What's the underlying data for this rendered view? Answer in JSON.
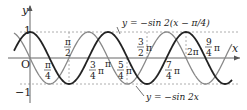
{
  "chart_data": {
    "type": "line",
    "title": "",
    "xlabel": "x",
    "ylabel": "y",
    "origin_label": "O",
    "ylim": [
      -1,
      1
    ],
    "xlim_radians": [
      -0.7,
      5.3
    ],
    "y_ticks": [
      "1",
      "-1"
    ],
    "x_tick_labels": [
      "π/4",
      "π/2",
      "3/4 π",
      "π",
      "5/4 π",
      "3/2 π",
      "7/4 π",
      "2π",
      "9/4 π"
    ],
    "series": [
      {
        "name": "y = -sin 2x",
        "style": "gray thin",
        "formula": "-sin(2x)",
        "x": [
          0,
          0.7854,
          1.5708,
          2.3562,
          3.1416,
          3.927,
          4.7124,
          5.4978,
          6.2832
        ],
        "y": [
          0,
          -1,
          0,
          1,
          0,
          -1,
          0,
          1,
          0
        ]
      },
      {
        "name": "y = -sin 2(x - π/4)",
        "style": "black thick",
        "formula": "-sin(2(x-π/4))",
        "x": [
          0,
          0.7854,
          1.5708,
          2.3562,
          3.1416,
          3.927,
          4.7124,
          5.4978,
          6.2832
        ],
        "y": [
          1,
          0,
          -1,
          0,
          1,
          0,
          -1,
          0,
          1
        ]
      }
    ],
    "annotations": [
      {
        "text": "y = −sin 2(x − π/4)",
        "points_to": "black curve"
      },
      {
        "text": "y = −sin 2x",
        "points_to": "gray curve"
      }
    ],
    "grid": false,
    "dashed_guides": [
      "y=1",
      "y=-1",
      "x=π/2",
      "x=3/2π",
      "x=2π",
      "x=5/4π"
    ]
  },
  "labels": {
    "y_axis": "y",
    "x_axis": "x",
    "origin": "O",
    "one": "1",
    "minus_one": "−1",
    "eq_top": "y = −sin 2(x − π/4)",
    "eq_bottom": "y = −sin 2x"
  }
}
